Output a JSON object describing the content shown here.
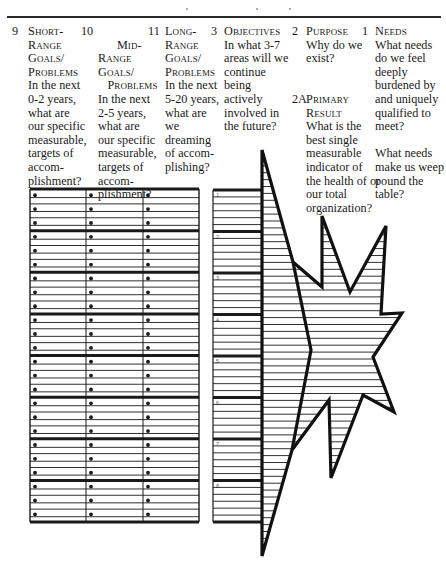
{
  "columns": [
    {
      "id": "short-range",
      "number": "9",
      "heading": "Short-\nRange\nGoals/\nProblems",
      "body": "In the next\n0-2 years,\nwhat are\nour specific\nmeasurable,\ntargets of\naccom-\nplishment?"
    },
    {
      "id": "mid-range",
      "number": "10",
      "heading": "Mid-\nRange\nGoals/\n   Problems",
      "body": "In the next\n2-5 years,\nwhat are\nour specific\nmeasurable,\ntargets of\naccom-\nplishment?"
    },
    {
      "id": "long-range",
      "number": "11",
      "heading": "Long-\nRange\nGoals/\nProblems",
      "body": "In the next\n5-20 years,\nwhat are\nwe\ndreaming\nof accom-\nplishing?"
    },
    {
      "id": "objectives",
      "number": "3",
      "heading": "Objectives",
      "body": "In what 3-7\nareas will we\ncontinue\n being\nactively\ninvolved in\nthe future?"
    },
    {
      "id": "purpose",
      "number": "2",
      "heading": "Purpose",
      "body": "Why do we\nexist?"
    },
    {
      "id": "primary-result",
      "number": "2A",
      "heading": "Primary\nResult",
      "body": "What is the\nbest single\nmeasurable\nindicator of\nthe health of or\nour total\norganization?"
    },
    {
      "id": "needs",
      "number": "1",
      "heading": "Needs",
      "body": "What needs\ndo we feel\ndeeply\nburdened by\nand uniquely\nqualified to\nmeet?\n\nWhat needs\nmake us weep\npound the\ntable?"
    }
  ],
  "goals_grid": {
    "groups": 8,
    "rows_per_group": 3,
    "columns": 3,
    "bullet": "•"
  },
  "objectives_grid": {
    "section_labels": [
      "1",
      "2",
      "3",
      "4",
      "5",
      "6",
      "7",
      "8"
    ],
    "lines_per_section": 6
  },
  "colors": {
    "ink": "#1a1a1a",
    "rule": "#2a2a2a",
    "paper": "#ffffff"
  }
}
